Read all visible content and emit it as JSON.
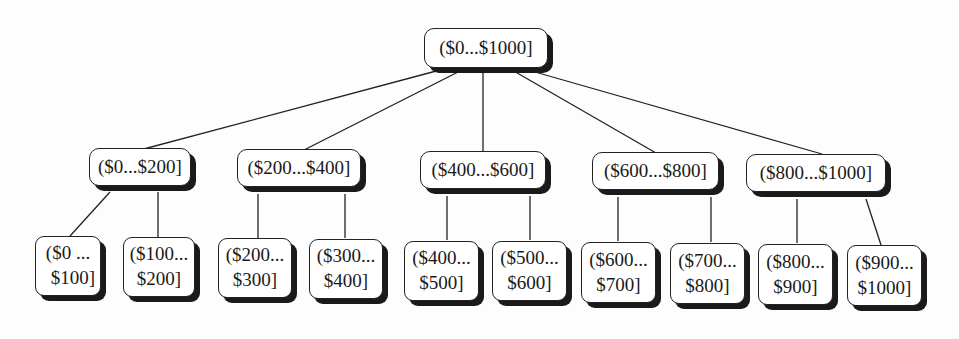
{
  "diagram": {
    "type": "tree",
    "root": {
      "label": "($0...$1000]"
    },
    "level1": [
      {
        "label": "($0...$200]"
      },
      {
        "label": "($200...$400]"
      },
      {
        "label": "($400...$600]"
      },
      {
        "label": "($600...$800]"
      },
      {
        "label": "($800...$1000]"
      }
    ],
    "leaves": [
      {
        "line1": "($0 ...",
        "line2": "$100]"
      },
      {
        "line1": "($100...",
        "line2": "$200]"
      },
      {
        "line1": "($200...",
        "line2": "$300]"
      },
      {
        "line1": "($300...",
        "line2": "$400]"
      },
      {
        "line1": "($400...",
        "line2": "$500]"
      },
      {
        "line1": "($500...",
        "line2": "$600]"
      },
      {
        "line1": "($600...",
        "line2": "$700]"
      },
      {
        "line1": "($700...",
        "line2": "$800]"
      },
      {
        "line1": "($800...",
        "line2": "$900]"
      },
      {
        "line1": "($900...",
        "line2": "$1000]"
      }
    ]
  }
}
